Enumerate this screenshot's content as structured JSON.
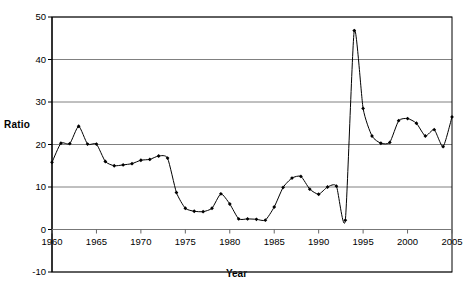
{
  "chart_data": {
    "type": "line",
    "title": "",
    "xlabel": "Year",
    "ylabel": "Ratio",
    "xlim": [
      1960,
      2005
    ],
    "ylim": [
      -10,
      50
    ],
    "ytick_labels": [
      "50",
      "40",
      "30",
      "20",
      "10",
      "0",
      "-10"
    ],
    "yticks": [
      50,
      40,
      30,
      20,
      10,
      0,
      -10
    ],
    "xtick_labels": [
      "1960",
      "1965",
      "1970",
      "1975",
      "1980",
      "1985",
      "1990",
      "1995",
      "2000",
      "2005"
    ],
    "xticks": [
      1960,
      1965,
      1970,
      1975,
      1980,
      1985,
      1990,
      1995,
      2000,
      2005
    ],
    "grid": "horizontal",
    "gridlines_at": [
      50,
      40,
      30,
      20,
      10,
      0,
      -10
    ],
    "legend": "none",
    "marker": "filled-diamond",
    "line_color": "#000000",
    "grid_color": "#808080",
    "axis_color": "#000000",
    "series": [
      {
        "name": "Ratio",
        "x": [
          1960,
          1961,
          1962,
          1963,
          1964,
          1965,
          1966,
          1967,
          1968,
          1969,
          1970,
          1971,
          1972,
          1973,
          1974,
          1975,
          1976,
          1977,
          1978,
          1979,
          1980,
          1981,
          1982,
          1983,
          1984,
          1985,
          1986,
          1987,
          1988,
          1989,
          1990,
          1991,
          1992,
          1993,
          1994,
          1995,
          1996,
          1997,
          1998,
          1999,
          2000,
          2001,
          2002,
          2003,
          2004,
          2005
        ],
        "values": [
          15.8,
          20.3,
          20.2,
          24.3,
          20.1,
          20.1,
          16.0,
          15.0,
          15.2,
          15.5,
          16.3,
          16.5,
          17.3,
          16.8,
          8.7,
          5.0,
          4.3,
          4.2,
          5.0,
          8.4,
          6.0,
          2.5,
          2.5,
          2.4,
          2.2,
          5.3,
          9.9,
          12.1,
          12.5,
          9.5,
          8.3,
          10.0,
          10.2,
          2.2,
          46.8,
          28.5,
          22.0,
          20.3,
          20.5,
          25.6,
          26.1,
          25.0,
          22.0,
          23.5,
          19.5,
          26.5
        ]
      }
    ]
  }
}
